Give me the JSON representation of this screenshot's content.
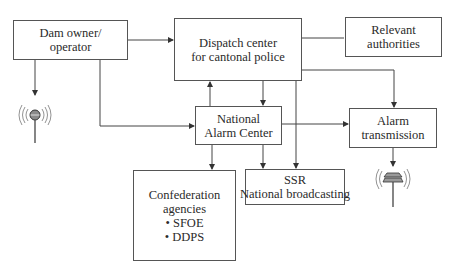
{
  "diagram": {
    "type": "flowchart",
    "title": "",
    "nodes": [
      {
        "id": "dam_owner",
        "lines": [
          "Dam owner/",
          "operator"
        ]
      },
      {
        "id": "dispatch",
        "lines": [
          "Dispatch center",
          "for cantonal police"
        ]
      },
      {
        "id": "authorities",
        "lines": [
          "Relevant",
          "authorities"
        ]
      },
      {
        "id": "nac",
        "lines": [
          "National",
          "Alarm Center"
        ]
      },
      {
        "id": "alarm_tx",
        "lines": [
          "Alarm",
          "transmission"
        ]
      },
      {
        "id": "confed",
        "lines": [
          "Confederation",
          "agencies",
          "• SFOE",
          "• DDPS"
        ]
      },
      {
        "id": "ssr",
        "lines": [
          "SSR",
          "National broadcasting"
        ]
      }
    ],
    "icons": [
      {
        "id": "siren_left",
        "name": "radio-siren-icon",
        "attached_to": "dam_owner"
      },
      {
        "id": "siren_right",
        "name": "alarm-siren-icon",
        "attached_to": "alarm_tx"
      }
    ],
    "edges": [
      {
        "from": "dam_owner",
        "to": "dispatch",
        "arrow": true
      },
      {
        "from": "dam_owner",
        "to": "siren_left",
        "arrow": true
      },
      {
        "from": "dam_owner",
        "to": "nac",
        "arrow": true
      },
      {
        "from": "dispatch",
        "to": "authorities",
        "arrow": false
      },
      {
        "from": "nac",
        "to": "dispatch",
        "arrow": true
      },
      {
        "from": "dispatch",
        "to": "nac",
        "arrow": true
      },
      {
        "from": "dispatch",
        "to": "ssr",
        "arrow": true
      },
      {
        "from": "dispatch",
        "to": "alarm_tx",
        "arrow": true
      },
      {
        "from": "nac",
        "to": "alarm_tx",
        "arrow": true
      },
      {
        "from": "nac",
        "to": "confed",
        "arrow": true
      },
      {
        "from": "nac",
        "to": "ssr",
        "arrow": true
      },
      {
        "from": "alarm_tx",
        "to": "siren_right",
        "arrow": true
      }
    ]
  },
  "colors": {
    "line": "#444444",
    "border": "#555555",
    "text": "#2a2a2a",
    "siren_fill": "#8a8a8a"
  }
}
